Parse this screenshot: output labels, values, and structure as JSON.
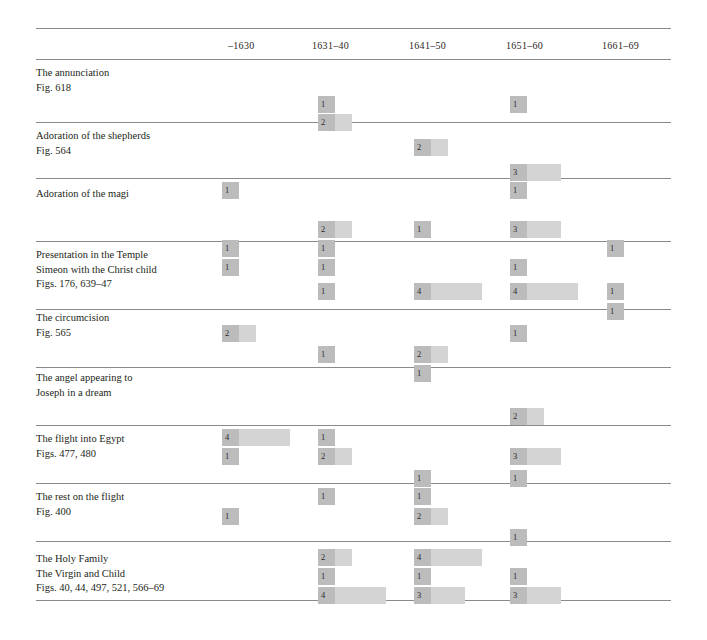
{
  "chart_data": {
    "type": "bar",
    "title": "",
    "xlabel": "",
    "ylabel": "",
    "grid": false,
    "legend": "none",
    "orientation": "horizontal",
    "categories": [
      "–1630",
      "1631–40",
      "1641–50",
      "1651–60",
      "1661–69"
    ],
    "value_unit": "works",
    "sections": [
      {
        "label_lines": [
          "The annunciation",
          "Fig. 618"
        ],
        "rows": [
          {
            "bars": [
              {
                "col": 1,
                "value": 1
              },
              {
                "col": 3,
                "value": 1
              }
            ]
          },
          {
            "bars": [
              {
                "col": 1,
                "value": 2
              }
            ]
          },
          {
            "bars": [
              {
                "col": 2,
                "value": 2
              }
            ]
          },
          {
            "bars": [
              {
                "col": 3,
                "value": 3
              }
            ]
          }
        ]
      },
      {
        "label_lines": [
          "Adoration of the shepherds",
          "Fig. 564"
        ],
        "rows": [
          {
            "bars": [
              {
                "col": 0,
                "value": 1
              },
              {
                "col": 3,
                "value": 1
              }
            ]
          },
          {
            "bars": [
              {
                "col": 1,
                "value": 2
              },
              {
                "col": 2,
                "value": 1
              },
              {
                "col": 3,
                "value": 3
              }
            ]
          }
        ]
      },
      {
        "label_lines": [
          "Adoration of the magi"
        ],
        "rows": [
          {
            "bars": [
              {
                "col": 0,
                "value": 1
              },
              {
                "col": 1,
                "value": 1
              },
              {
                "col": 4,
                "value": 1
              }
            ]
          },
          {
            "bars": [
              {
                "col": 0,
                "value": 1
              },
              {
                "col": 1,
                "value": 1
              },
              {
                "col": 3,
                "value": 1
              }
            ]
          },
          {
            "bars": [
              {
                "col": 1,
                "value": 1
              },
              {
                "col": 2,
                "value": 4
              },
              {
                "col": 3,
                "value": 4
              },
              {
                "col": 4,
                "value": 1
              }
            ]
          }
        ]
      },
      {
        "label_lines": [
          "Presentation in the Temple",
          "Simeon with the Christ child",
          "Figs. 176, 639–47"
        ],
        "rows": [
          {
            "bars": [
              {
                "col": 4,
                "value": 1
              }
            ]
          },
          {
            "bars": [
              {
                "col": 0,
                "value": 2
              },
              {
                "col": 3,
                "value": 1
              }
            ]
          },
          {
            "bars": [
              {
                "col": 1,
                "value": 1
              },
              {
                "col": 2,
                "value": 2
              }
            ]
          }
        ]
      },
      {
        "label_lines": [
          "The circumcision",
          "Fig. 565"
        ],
        "rows": [
          {
            "bars": [
              {
                "col": 2,
                "value": 1
              }
            ]
          },
          {
            "bars": []
          },
          {
            "bars": [
              {
                "col": 3,
                "value": 2
              }
            ]
          }
        ]
      },
      {
        "label_lines": [
          "The angel appearing to",
          "Joseph in a dream"
        ],
        "rows": [
          {
            "bars": [
              {
                "col": 0,
                "value": 4
              },
              {
                "col": 1,
                "value": 1
              }
            ]
          },
          {
            "bars": [
              {
                "col": 0,
                "value": 1
              },
              {
                "col": 1,
                "value": 2
              },
              {
                "col": 3,
                "value": 3
              }
            ]
          },
          {
            "bars": [
              {
                "col": 2,
                "value": 1
              },
              {
                "col": 3,
                "value": 1
              }
            ]
          }
        ]
      },
      {
        "label_lines": [
          "The flight into Egypt",
          "Figs. 477, 480"
        ],
        "rows": [
          {
            "bars": [
              {
                "col": 1,
                "value": 1
              },
              {
                "col": 2,
                "value": 1
              }
            ]
          },
          {
            "bars": [
              {
                "col": 0,
                "value": 1
              },
              {
                "col": 2,
                "value": 2
              }
            ]
          },
          {
            "bars": [
              {
                "col": 3,
                "value": 1
              }
            ]
          }
        ]
      },
      {
        "label_lines": [
          "The rest on the flight",
          "Fig. 400"
        ],
        "rows": [
          {
            "bars": [
              {
                "col": 1,
                "value": 2
              },
              {
                "col": 2,
                "value": 4
              }
            ]
          },
          {
            "bars": [
              {
                "col": 1,
                "value": 1
              },
              {
                "col": 2,
                "value": 1
              },
              {
                "col": 3,
                "value": 1
              }
            ]
          },
          {
            "bars": [
              {
                "col": 1,
                "value": 4
              },
              {
                "col": 2,
                "value": 3
              },
              {
                "col": 3,
                "value": 3
              }
            ]
          }
        ]
      },
      {
        "label_lines": [
          "The Holy Family",
          "The Virgin and Child",
          "Figs. 40, 44, 497, 521, 566–69"
        ],
        "rows": []
      }
    ]
  },
  "colors": {
    "bar_head": "#bcbcbc",
    "bar_tail": "#d4d4d4",
    "rule": "#8a8a8a",
    "text": "#231f20",
    "background": "#ffffff"
  },
  "layout": {
    "col_x": [
      222,
      318,
      414,
      510,
      607
    ],
    "header_x": [
      228,
      312,
      409,
      506,
      602
    ],
    "unit_width": 17,
    "row_height": 17,
    "rules_y": [
      28,
      59,
      122,
      178,
      241,
      309,
      367,
      425,
      483,
      541,
      600
    ],
    "sections_y": [
      66,
      129,
      187,
      248,
      311,
      371,
      432,
      490,
      552
    ]
  },
  "bars_absolute": [
    {
      "y": 96,
      "col": 1,
      "value": 1
    },
    {
      "y": 96,
      "col": 3,
      "value": 1
    },
    {
      "y": 114,
      "col": 1,
      "value": 2
    },
    {
      "y": 139,
      "col": 2,
      "value": 2
    },
    {
      "y": 164,
      "col": 3,
      "value": 3
    },
    {
      "y": 182,
      "col": 0,
      "value": 1
    },
    {
      "y": 182,
      "col": 3,
      "value": 1
    },
    {
      "y": 221,
      "col": 1,
      "value": 2
    },
    {
      "y": 221,
      "col": 2,
      "value": 1
    },
    {
      "y": 221,
      "col": 3,
      "value": 3
    },
    {
      "y": 240,
      "col": 0,
      "value": 1
    },
    {
      "y": 240,
      "col": 1,
      "value": 1
    },
    {
      "y": 240,
      "col": 4,
      "value": 1
    },
    {
      "y": 259,
      "col": 0,
      "value": 1
    },
    {
      "y": 259,
      "col": 1,
      "value": 1
    },
    {
      "y": 259,
      "col": 3,
      "value": 1
    },
    {
      "y": 283,
      "col": 1,
      "value": 1
    },
    {
      "y": 283,
      "col": 2,
      "value": 4
    },
    {
      "y": 283,
      "col": 3,
      "value": 4
    },
    {
      "y": 283,
      "col": 4,
      "value": 1
    },
    {
      "y": 303,
      "col": 4,
      "value": 1
    },
    {
      "y": 325,
      "col": 0,
      "value": 2
    },
    {
      "y": 325,
      "col": 3,
      "value": 1
    },
    {
      "y": 346,
      "col": 1,
      "value": 1
    },
    {
      "y": 346,
      "col": 2,
      "value": 2
    },
    {
      "y": 365,
      "col": 2,
      "value": 1
    },
    {
      "y": 408,
      "col": 3,
      "value": 2
    },
    {
      "y": 429,
      "col": 0,
      "value": 4
    },
    {
      "y": 429,
      "col": 1,
      "value": 1
    },
    {
      "y": 448,
      "col": 0,
      "value": 1
    },
    {
      "y": 448,
      "col": 1,
      "value": 2
    },
    {
      "y": 448,
      "col": 3,
      "value": 3
    },
    {
      "y": 470,
      "col": 2,
      "value": 1
    },
    {
      "y": 470,
      "col": 3,
      "value": 1
    },
    {
      "y": 488,
      "col": 1,
      "value": 1
    },
    {
      "y": 488,
      "col": 2,
      "value": 1
    },
    {
      "y": 508,
      "col": 0,
      "value": 1
    },
    {
      "y": 508,
      "col": 2,
      "value": 2
    },
    {
      "y": 529,
      "col": 3,
      "value": 1
    },
    {
      "y": 549,
      "col": 1,
      "value": 2
    },
    {
      "y": 549,
      "col": 2,
      "value": 4
    },
    {
      "y": 568,
      "col": 1,
      "value": 1
    },
    {
      "y": 568,
      "col": 2,
      "value": 1
    },
    {
      "y": 568,
      "col": 3,
      "value": 1
    },
    {
      "y": 587,
      "col": 1,
      "value": 4
    },
    {
      "y": 587,
      "col": 2,
      "value": 3
    },
    {
      "y": 587,
      "col": 3,
      "value": 3
    }
  ]
}
